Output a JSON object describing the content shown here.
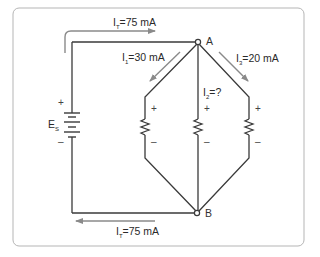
{
  "diagram": {
    "type": "parallel-circuit",
    "colors": {
      "wire": "#3a3a3a",
      "arrow": "#8a8a8a",
      "frame": "#b5b5b5",
      "text": "#2a2a2a"
    },
    "source": {
      "label_main": "E",
      "label_sub": "S",
      "plus": "+",
      "minus": "–"
    },
    "nodes": {
      "a": "A",
      "b": "B"
    },
    "currents": {
      "top_total": {
        "main": "I",
        "sub": "T",
        "value": "=75 mA"
      },
      "bottom_total": {
        "main": "I",
        "sub": "T",
        "value": "=75 mA"
      },
      "branch1": {
        "main": "I",
        "sub": "1",
        "value": "=30 mA"
      },
      "branch2": {
        "main": "I",
        "sub": "2",
        "value": "=?"
      },
      "branch3": {
        "main": "I",
        "sub": "3",
        "value": "=20 mA"
      }
    },
    "resistors": [
      {
        "plus": "+",
        "minus": "–"
      },
      {
        "plus": "+",
        "minus": "–"
      },
      {
        "plus": "+",
        "minus": "–"
      }
    ]
  }
}
